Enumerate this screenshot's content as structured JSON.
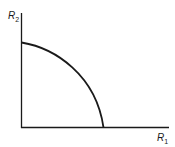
{
  "diagram": {
    "type": "capacity-region",
    "axes": {
      "x_label": "R",
      "x_label_sub": "1",
      "y_label": "R",
      "y_label_sub": "2"
    },
    "curve": {
      "shape": "concave quarter-ellipse arc",
      "from": "y-axis intercept",
      "to": "x-axis intercept"
    },
    "colors": {
      "line": "#1a1a1a",
      "background": "#ffffff"
    }
  }
}
